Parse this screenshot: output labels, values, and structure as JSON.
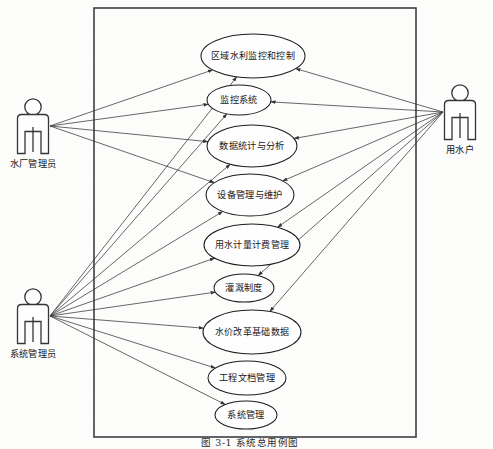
{
  "diagram": {
    "type": "uml-use-case-diagram",
    "caption": "图 3-1  系统总用例图",
    "boundary": {
      "name": "system-boundary",
      "x": 94,
      "y": 8,
      "width": 322,
      "height": 429
    },
    "colors": {
      "background": "#fdfdfc",
      "stroke": "#1d1d20",
      "boundary_stroke": "#3f3f44",
      "association": "#35353a",
      "text": "#17171a",
      "ellipse_fill": "#ffffff"
    },
    "actors": [
      {
        "id": "water-plant-admin",
        "label": "水厂管理员",
        "x": 33,
        "y": 128,
        "label_x": 33,
        "label_y": 167,
        "position": "left-top"
      },
      {
        "id": "system-admin",
        "label": "系统管理员",
        "x": 33,
        "y": 318,
        "label_x": 33,
        "label_y": 357,
        "position": "left-bottom"
      },
      {
        "id": "water-user",
        "label": "用水户",
        "x": 460,
        "y": 114,
        "label_x": 460,
        "label_y": 153,
        "position": "right"
      }
    ],
    "use_cases": [
      {
        "id": "uc1",
        "label": "区域水利监控和控制",
        "cx": 253,
        "cy": 56,
        "rx": 52,
        "ry": 22
      },
      {
        "id": "uc2",
        "label": "监控系统",
        "cx": 239,
        "cy": 100,
        "rx": 32,
        "ry": 15
      },
      {
        "id": "uc3",
        "label": "数据统计与分析",
        "cx": 252,
        "cy": 146,
        "rx": 45,
        "ry": 21
      },
      {
        "id": "uc4",
        "label": "设备管理与维护",
        "cx": 250,
        "cy": 195,
        "rx": 44,
        "ry": 21
      },
      {
        "id": "uc5",
        "label": "用水计量计费管理",
        "cx": 252,
        "cy": 245,
        "rx": 48,
        "ry": 21
      },
      {
        "id": "uc6",
        "label": "灌溉制度",
        "cx": 244,
        "cy": 288,
        "rx": 30,
        "ry": 14
      },
      {
        "id": "uc7",
        "label": "水价改革基础数据",
        "cx": 252,
        "cy": 332,
        "rx": 49,
        "ry": 22
      },
      {
        "id": "uc8",
        "label": "工程文档管理",
        "cx": 247,
        "cy": 378,
        "rx": 39,
        "ry": 17
      },
      {
        "id": "uc9",
        "label": "系统管理",
        "cx": 246,
        "cy": 415,
        "rx": 31,
        "ry": 14
      }
    ],
    "associations": [
      {
        "from": "water-plant-admin",
        "to": "uc1",
        "direction": "to-use-case"
      },
      {
        "from": "water-plant-admin",
        "to": "uc2",
        "direction": "to-use-case"
      },
      {
        "from": "water-plant-admin",
        "to": "uc3",
        "direction": "to-use-case"
      },
      {
        "from": "water-plant-admin",
        "to": "uc4",
        "direction": "to-use-case"
      },
      {
        "from": "system-admin",
        "to": "uc1",
        "direction": "to-use-case"
      },
      {
        "from": "system-admin",
        "to": "uc2",
        "direction": "to-use-case"
      },
      {
        "from": "system-admin",
        "to": "uc3",
        "direction": "to-use-case"
      },
      {
        "from": "system-admin",
        "to": "uc4",
        "direction": "to-use-case"
      },
      {
        "from": "system-admin",
        "to": "uc5",
        "direction": "to-use-case"
      },
      {
        "from": "system-admin",
        "to": "uc6",
        "direction": "to-use-case"
      },
      {
        "from": "system-admin",
        "to": "uc7",
        "direction": "to-use-case"
      },
      {
        "from": "system-admin",
        "to": "uc8",
        "direction": "to-use-case"
      },
      {
        "from": "system-admin",
        "to": "uc9",
        "direction": "to-use-case"
      },
      {
        "from": "water-user",
        "to": "uc1",
        "direction": "to-use-case"
      },
      {
        "from": "water-user",
        "to": "uc2",
        "direction": "to-use-case"
      },
      {
        "from": "water-user",
        "to": "uc3",
        "direction": "to-use-case"
      },
      {
        "from": "water-user",
        "to": "uc4",
        "direction": "to-use-case"
      },
      {
        "from": "water-user",
        "to": "uc5",
        "direction": "to-use-case"
      },
      {
        "from": "water-user",
        "to": "uc6",
        "direction": "to-use-case"
      },
      {
        "from": "water-user",
        "to": "uc7",
        "direction": "to-use-case"
      }
    ]
  }
}
